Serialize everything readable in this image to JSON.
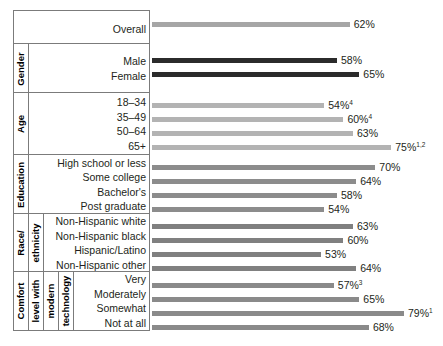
{
  "chart_data": {
    "type": "bar",
    "title": "",
    "subtitle": "",
    "xlabel": "",
    "ylabel": "",
    "orientation": "horizontal",
    "grid": false,
    "legend": "none",
    "value_suffix": "%",
    "xlim": [
      0,
      85
    ],
    "bar_start_px": 152,
    "groups": [
      {
        "group_label": "",
        "color": "#a6a6a6",
        "categories": [
          "Overall"
        ],
        "values": [
          62
        ],
        "value_labels": [
          "62%"
        ],
        "superscripts": [
          ""
        ]
      },
      {
        "group_label": "Gender",
        "color": "#2b2b2b",
        "categories": [
          "Male",
          "Female"
        ],
        "values": [
          58,
          65
        ],
        "value_labels": [
          "58%",
          "65%"
        ],
        "superscripts": [
          "",
          ""
        ]
      },
      {
        "group_label": "Age",
        "color": "#b3b3b3",
        "categories": [
          "18–34",
          "35–49",
          "50–64",
          "65+"
        ],
        "values": [
          54,
          60,
          63,
          75
        ],
        "value_labels": [
          "54%",
          "60%",
          "63%",
          "75%"
        ],
        "superscripts": [
          "4",
          "4",
          "",
          "1,2"
        ]
      },
      {
        "group_label": "Education",
        "color": "#8c8c8c",
        "categories": [
          "High school or less",
          "Some college",
          "Bachelor's",
          "Post graduate"
        ],
        "values": [
          70,
          64,
          58,
          54
        ],
        "value_labels": [
          "70%",
          "64%",
          "58%",
          "54%"
        ],
        "superscripts": [
          "",
          "",
          "",
          ""
        ]
      },
      {
        "group_label": "Race/\nethnicity",
        "color": "#808080",
        "categories": [
          "Non-Hispanic white",
          "Non-Hispanic black",
          "Hispanic/Latino",
          "Non-Hispanic other"
        ],
        "values": [
          63,
          60,
          53,
          64
        ],
        "value_labels": [
          "63%",
          "60%",
          "53%",
          "64%"
        ],
        "superscripts": [
          "",
          "",
          "",
          ""
        ]
      },
      {
        "group_label": "Comfort\nlevel with\nmodern\ntechnology",
        "color": "#8a8a8a",
        "categories": [
          "Very",
          "Moderately",
          "Somewhat",
          "Not at all"
        ],
        "values": [
          57,
          65,
          79,
          68
        ],
        "value_labels": [
          "57%",
          "65%",
          "79%",
          "68%"
        ],
        "superscripts": [
          "3",
          "",
          "1",
          ""
        ]
      }
    ]
  },
  "sections": [
    {
      "title_lines": [],
      "top": 10,
      "height": 38,
      "labels": [
        "Overall"
      ]
    },
    {
      "title_lines": [
        "Gender"
      ],
      "top": 43,
      "height": 50,
      "labels": [
        "Male",
        "Female"
      ]
    },
    {
      "title_lines": [
        "Age"
      ],
      "top": 92,
      "height": 63,
      "labels": [
        "18–34",
        "35–49",
        "50–64",
        "65+"
      ]
    },
    {
      "title_lines": [
        "Education"
      ],
      "top": 154,
      "height": 60,
      "labels": [
        "High school or less",
        "Some college",
        "Bachelor's",
        "Post graduate"
      ]
    },
    {
      "title_lines": [
        "Race/",
        "ethnicity"
      ],
      "top": 213,
      "height": 59,
      "labels": [
        "Non-Hispanic white",
        "Non-Hispanic black",
        "Hispanic/Latino",
        "Non-Hispanic other"
      ]
    },
    {
      "title_lines": [
        "Comfort",
        "level with",
        "modern",
        "technology"
      ],
      "top": 271,
      "height": 60,
      "labels": [
        "Very",
        "Moderately",
        "Somewhat",
        "Not at all"
      ]
    }
  ],
  "bar_rows": [
    {
      "top": 17,
      "value": 62,
      "label": "62%",
      "sup": "",
      "color": "#a6a6a6"
    },
    {
      "top": 53,
      "value": 58,
      "label": "58%",
      "sup": "",
      "color": "#2b2b2b"
    },
    {
      "top": 67,
      "value": 65,
      "label": "65%",
      "sup": "",
      "color": "#2b2b2b"
    },
    {
      "top": 98,
      "value": 54,
      "label": "54%",
      "sup": "4",
      "color": "#b3b3b3"
    },
    {
      "top": 112,
      "value": 60,
      "label": "60%",
      "sup": "4",
      "color": "#b3b3b3"
    },
    {
      "top": 126,
      "value": 63,
      "label": "63%",
      "sup": "",
      "color": "#b3b3b3"
    },
    {
      "top": 140,
      "value": 75,
      "label": "75%",
      "sup": "1,2",
      "color": "#b3b3b3"
    },
    {
      "top": 160,
      "value": 70,
      "label": "70%",
      "sup": "",
      "color": "#8c8c8c"
    },
    {
      "top": 174,
      "value": 64,
      "label": "64%",
      "sup": "",
      "color": "#8c8c8c"
    },
    {
      "top": 188,
      "value": 58,
      "label": "58%",
      "sup": "",
      "color": "#8c8c8c"
    },
    {
      "top": 202,
      "value": 54,
      "label": "54%",
      "sup": "",
      "color": "#8c8c8c"
    },
    {
      "top": 219,
      "value": 63,
      "label": "63%",
      "sup": "",
      "color": "#808080"
    },
    {
      "top": 233,
      "value": 60,
      "label": "60%",
      "sup": "",
      "color": "#808080"
    },
    {
      "top": 247,
      "value": 53,
      "label": "53%",
      "sup": "",
      "color": "#808080"
    },
    {
      "top": 261,
      "value": 64,
      "label": "64%",
      "sup": "",
      "color": "#808080"
    },
    {
      "top": 278,
      "value": 57,
      "label": "57%",
      "sup": "3",
      "color": "#8a8a8a"
    },
    {
      "top": 292,
      "value": 65,
      "label": "65%",
      "sup": "",
      "color": "#8a8a8a"
    },
    {
      "top": 306,
      "value": 79,
      "label": "79%",
      "sup": "1",
      "color": "#8a8a8a"
    },
    {
      "top": 320,
      "value": 68,
      "label": "68%",
      "sup": "",
      "color": "#8a8a8a"
    }
  ],
  "scale": {
    "px_per_unit": 3.19,
    "origin_px": 152
  }
}
